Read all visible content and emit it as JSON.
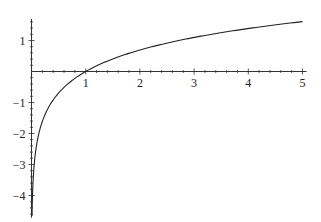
{
  "chart_data": {
    "type": "line",
    "title": "",
    "xlabel": "",
    "ylabel": "",
    "function": "log(x)",
    "xlim": [
      0,
      5
    ],
    "ylim": [
      -4.65,
      1.6
    ],
    "grid": false,
    "legend": null,
    "x_ticks": [
      1,
      2,
      3,
      4,
      5
    ],
    "x_tick_labels": [
      "1",
      "2",
      "3",
      "4",
      "5"
    ],
    "y_ticks": [
      -4,
      -3,
      -2,
      -1,
      1
    ],
    "y_tick_labels": [
      "−4",
      "−3",
      "−2",
      "−1",
      "1"
    ],
    "series": [
      {
        "name": "log(x)",
        "x": [
          0.01,
          0.05,
          0.1,
          0.2,
          0.3,
          0.5,
          0.75,
          1,
          1.5,
          2,
          2.5,
          3,
          3.5,
          4,
          4.5,
          5
        ],
        "values": [
          -4.61,
          -3.0,
          -2.3,
          -1.61,
          -1.2,
          -0.69,
          -0.29,
          0,
          0.41,
          0.69,
          0.92,
          1.1,
          1.25,
          1.39,
          1.5,
          1.61
        ],
        "color": "#222222"
      }
    ]
  }
}
